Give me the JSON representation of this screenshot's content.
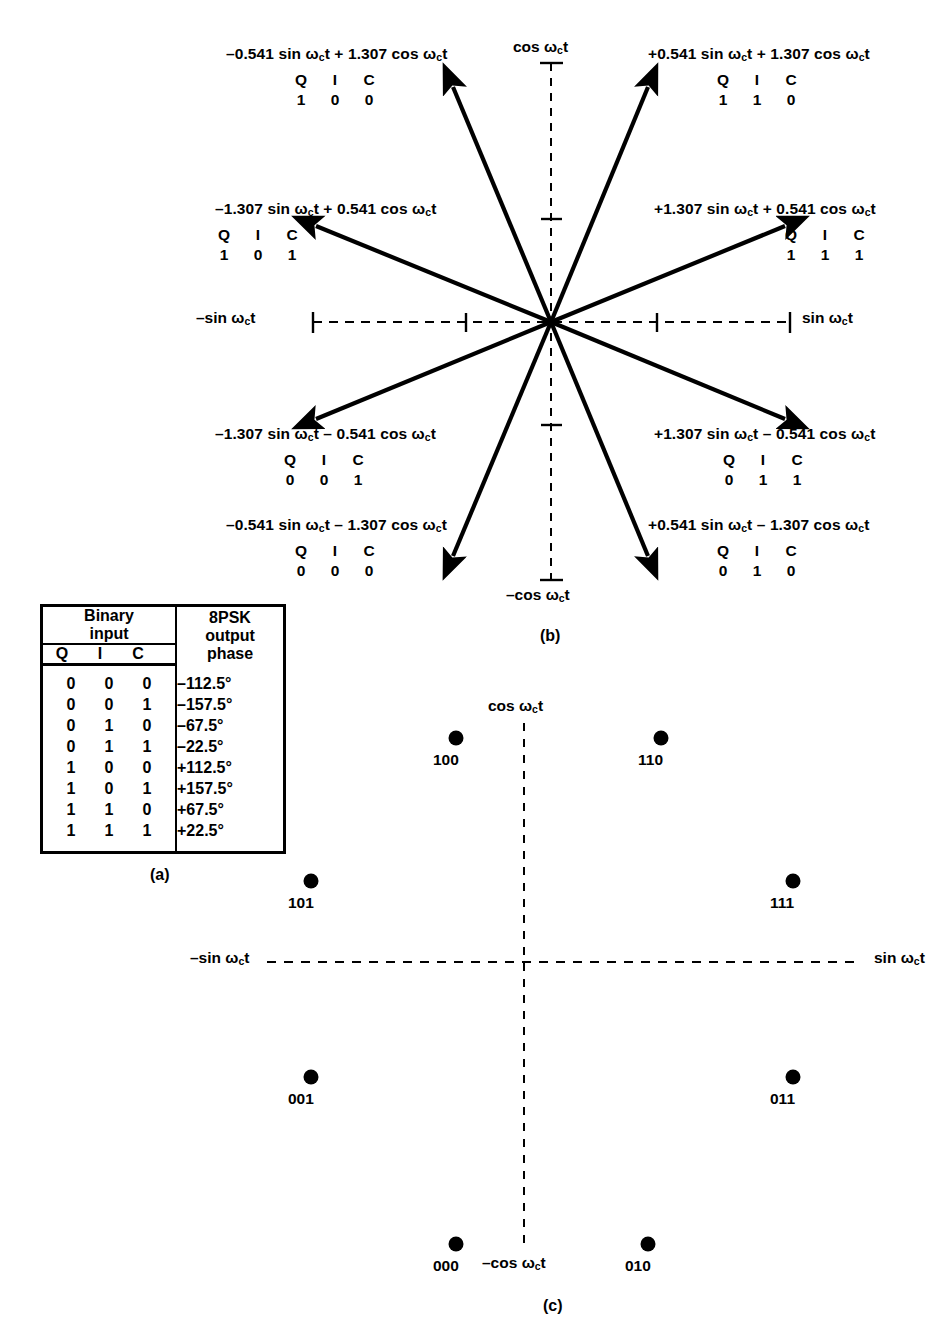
{
  "figure": {
    "captions": {
      "a": "(a)",
      "b": "(b)",
      "c": "(c)"
    }
  },
  "truth_table": {
    "header": {
      "binary_input": "Binary\ninput",
      "binary_input_line1": "Binary",
      "binary_input_line2": "input",
      "output_line1": "8PSK",
      "output_line2": "output",
      "output_line3": "phase",
      "q": "Q",
      "i": "I",
      "c": "C"
    },
    "rows": [
      {
        "q": "0",
        "i": "0",
        "c": "0",
        "phase": "–112.5°"
      },
      {
        "q": "0",
        "i": "0",
        "c": "1",
        "phase": "–157.5°"
      },
      {
        "q": "0",
        "i": "1",
        "c": "0",
        "phase": "–67.5°"
      },
      {
        "q": "0",
        "i": "1",
        "c": "1",
        "phase": "–22.5°"
      },
      {
        "q": "1",
        "i": "0",
        "c": "0",
        "phase": "+112.5°"
      },
      {
        "q": "1",
        "i": "0",
        "c": "1",
        "phase": "+157.5°"
      },
      {
        "q": "1",
        "i": "1",
        "c": "0",
        "phase": "+67.5°"
      },
      {
        "q": "1",
        "i": "1",
        "c": "1",
        "phase": "+22.5°"
      }
    ]
  },
  "phasor_diagram": {
    "axes": {
      "cos": "cos ωct",
      "neg_cos": "–cos ωct",
      "sin": "sin ωct",
      "neg_sin": "–sin ωct"
    },
    "qic_header": {
      "q": "Q",
      "i": "I",
      "c": "C"
    },
    "phasors": [
      {
        "id": "phasor-100",
        "equation": "–0.541 sin ωct + 1.307 cos ωct",
        "q": "1",
        "i": "0",
        "c": "0",
        "phase_deg": -22.5,
        "x": -0.541,
        "y": 1.307
      },
      {
        "id": "phasor-110",
        "equation": "+0.541 sin ωct + 1.307 cos ωct",
        "q": "1",
        "i": "1",
        "c": "0",
        "phase_deg": 22.5,
        "x": 0.541,
        "y": 1.307
      },
      {
        "id": "phasor-101",
        "equation": "–1.307 sin ωct + 0.541 cos ωct",
        "q": "1",
        "i": "0",
        "c": "1",
        "phase_deg": -67.5,
        "x": -1.307,
        "y": 0.541
      },
      {
        "id": "phasor-111",
        "equation": "+1.307 sin ωct + 0.541 cos ωct",
        "q": "1",
        "i": "1",
        "c": "1",
        "phase_deg": 67.5,
        "x": 1.307,
        "y": 0.541
      },
      {
        "id": "phasor-001",
        "equation": "–1.307 sin ωct – 0.541 cos ωct",
        "q": "0",
        "i": "0",
        "c": "1",
        "phase_deg": -112.5,
        "x": -1.307,
        "y": -0.541
      },
      {
        "id": "phasor-011",
        "equation": "+1.307 sin ωct – 0.541 cos ωct",
        "q": "0",
        "i": "1",
        "c": "1",
        "phase_deg": 112.5,
        "x": 1.307,
        "y": -0.541
      },
      {
        "id": "phasor-000",
        "equation": "–0.541 sin ωct – 1.307 cos ωct",
        "q": "0",
        "i": "0",
        "c": "0",
        "phase_deg": -157.5,
        "x": -0.541,
        "y": -1.307
      },
      {
        "id": "phasor-010",
        "equation": "+0.541 sin ωct – 1.307 cos ωct",
        "q": "0",
        "i": "1",
        "c": "0",
        "phase_deg": 157.5,
        "x": 0.541,
        "y": -1.307
      }
    ]
  },
  "constellation_diagram": {
    "axes": {
      "cos": "cos ωct",
      "neg_cos": "–cos ωct",
      "sin": "sin ωct",
      "neg_sin": "–sin ωct"
    },
    "points": [
      {
        "label": "100",
        "x": -0.541,
        "y": 1.307
      },
      {
        "label": "110",
        "x": 0.541,
        "y": 1.307
      },
      {
        "label": "101",
        "x": -1.307,
        "y": 0.541
      },
      {
        "label": "111",
        "x": 1.307,
        "y": 0.541
      },
      {
        "label": "001",
        "x": -1.307,
        "y": -0.541
      },
      {
        "label": "011",
        "x": 1.307,
        "y": -0.541
      },
      {
        "label": "000",
        "x": -0.541,
        "y": -1.307
      },
      {
        "label": "010",
        "x": 0.541,
        "y": -1.307
      }
    ]
  },
  "chart_data": {
    "type": "scatter",
    "xlabel": "sin ωct",
    "ylabel": "cos ωct",
    "xlim": [
      -1.6,
      1.6
    ],
    "ylim": [
      -1.6,
      1.6
    ],
    "grid": false,
    "legend": null,
    "categories": [
      "000",
      "001",
      "010",
      "011",
      "100",
      "101",
      "110",
      "111"
    ],
    "series": [
      {
        "name": "8PSK constellation points (I/Q)",
        "points": [
          {
            "label": "000",
            "x": -0.541,
            "y": -1.307,
            "phase_deg": -112.5
          },
          {
            "label": "001",
            "x": -1.307,
            "y": -0.541,
            "phase_deg": -157.5
          },
          {
            "label": "010",
            "x": 0.541,
            "y": -1.307,
            "phase_deg": -67.5
          },
          {
            "label": "011",
            "x": 1.307,
            "y": -0.541,
            "phase_deg": -22.5
          },
          {
            "label": "100",
            "x": -0.541,
            "y": 1.307,
            "phase_deg": 112.5
          },
          {
            "label": "101",
            "x": -1.307,
            "y": 0.541,
            "phase_deg": 157.5
          },
          {
            "label": "110",
            "x": 0.541,
            "y": 1.307,
            "phase_deg": 67.5
          },
          {
            "label": "111",
            "x": 1.307,
            "y": 0.541,
            "phase_deg": 22.5
          }
        ]
      }
    ],
    "annotations": [
      "–0.541 sin ωct + 1.307 cos ωct",
      "+0.541 sin ωct + 1.307 cos ωct",
      "–1.307 sin ωct + 0.541 cos ωct",
      "+1.307 sin ωct + 0.541 cos ωct",
      "–1.307 sin ωct – 0.541 cos ωct",
      "+1.307 sin ωct – 0.541 cos ωct",
      "–0.541 sin ωct – 1.307 cos ωct",
      "+0.541 sin ωct – 1.307 cos ωct"
    ]
  }
}
